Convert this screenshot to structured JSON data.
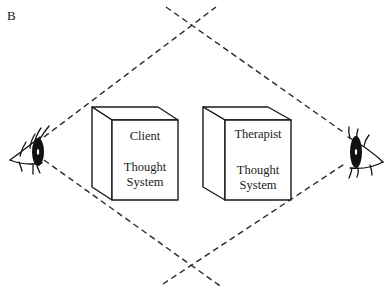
{
  "figure": {
    "panel_label": "B",
    "boxes": [
      {
        "id": "client",
        "title": "Client",
        "line1": "Thought",
        "line2": "System"
      },
      {
        "id": "therapist",
        "title": "Therapist",
        "line1": "Thought",
        "line2": "System"
      }
    ],
    "eyes": [
      {
        "id": "left-eye",
        "facing": "right"
      },
      {
        "id": "right-eye",
        "facing": "left"
      }
    ],
    "line_style": "dashed",
    "colors": {
      "ink": "#1a1a1a",
      "background": "#ffffff"
    }
  }
}
